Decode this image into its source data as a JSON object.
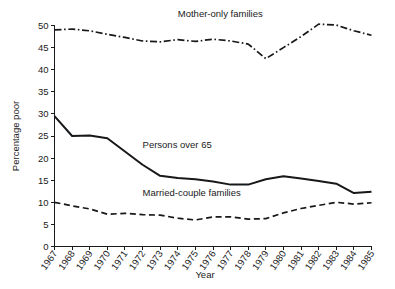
{
  "chart_data": {
    "type": "line",
    "title": "",
    "xlabel": "Year",
    "ylabel": "Percentage poor",
    "x": [
      1967,
      1968,
      1969,
      1970,
      1971,
      1972,
      1973,
      1974,
      1975,
      1976,
      1977,
      1978,
      1979,
      1980,
      1981,
      1982,
      1983,
      1984,
      1985
    ],
    "xtick_labels": [
      "1967",
      "1968",
      "1969",
      "1970",
      "1971",
      "1972",
      "1973",
      "1974",
      "1975",
      "1976",
      "1977",
      "1978",
      "1979",
      "1980",
      "1981",
      "1982",
      "1983",
      "1984",
      "1985"
    ],
    "ytick_labels": [
      "0",
      "5",
      "10",
      "15",
      "20",
      "25",
      "30",
      "35",
      "40",
      "45",
      "50"
    ],
    "yticks": [
      0,
      5,
      10,
      15,
      20,
      25,
      30,
      35,
      40,
      45,
      50
    ],
    "ylim": [
      0,
      50
    ],
    "xlim": [
      1967,
      1985
    ],
    "grid": false,
    "legend_position": "inline-annotations",
    "series": [
      {
        "name": "Mother-only families",
        "style": "dash-dot",
        "label_x": 1974,
        "label_y": 52,
        "values": [
          49.0,
          49.2,
          48.8,
          48.0,
          47.3,
          46.5,
          46.3,
          46.8,
          46.4,
          46.9,
          46.5,
          45.8,
          42.5,
          45.0,
          47.5,
          50.3,
          50.1,
          48.8,
          47.8
        ]
      },
      {
        "name": "Persons over 65",
        "style": "solid",
        "label_x": 1972,
        "label_y": 22.2,
        "values": [
          29.5,
          25.0,
          25.1,
          24.5,
          21.5,
          18.5,
          16.0,
          15.5,
          15.2,
          14.7,
          14.0,
          14.0,
          15.2,
          15.9,
          15.4,
          14.8,
          14.2,
          12.1,
          12.4
        ]
      },
      {
        "name": "Married-couple families",
        "style": "dashed",
        "label_x": 1972,
        "label_y": 11.4,
        "values": [
          10.0,
          9.2,
          8.5,
          7.3,
          7.5,
          7.2,
          7.1,
          6.4,
          6.0,
          6.7,
          6.7,
          6.2,
          6.3,
          7.6,
          8.6,
          9.3,
          10.0,
          9.6,
          9.9
        ]
      }
    ]
  },
  "figure": {
    "ylabel_text": "Percentage poor",
    "xlabel_text": "Year"
  }
}
